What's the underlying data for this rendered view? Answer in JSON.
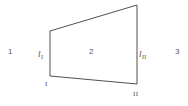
{
  "figure": {
    "type": "geometric-diagram",
    "background_color": "#ffffff",
    "stroke_color": "#55504f",
    "stroke_width": 1,
    "canvas": {
      "width": 188,
      "height": 106
    }
  },
  "shape": {
    "name": "quadrilateral",
    "vertices": [
      {
        "id": "top-left",
        "x": 50,
        "y": 31
      },
      {
        "id": "top-right",
        "x": 137,
        "y": 5
      },
      {
        "id": "bottom-right",
        "x": 137,
        "y": 84
      },
      {
        "id": "bottom-left",
        "x": 50,
        "y": 76
      }
    ],
    "path": "M 50 31 L 137 5 L 137 84 L 50 76 Z"
  },
  "regions": [
    {
      "id": "region-1",
      "label": "1",
      "position": "left-exterior"
    },
    {
      "id": "region-2",
      "label": "2",
      "position": "interior"
    },
    {
      "id": "region-3",
      "label": "3",
      "position": "right-exterior"
    }
  ],
  "edge_labels": [
    {
      "id": "edge-I",
      "symbol": "l",
      "subscript": "I",
      "edge": "left-vertical"
    },
    {
      "id": "edge-II",
      "symbol": "l",
      "subscript": "II",
      "edge": "right-vertical"
    }
  ],
  "vertex_labels": [
    {
      "id": "vertex-I",
      "label": "I",
      "anchor": "bottom-left-vertex"
    },
    {
      "id": "vertex-II",
      "label": "II",
      "anchor": "bottom-right-vertex"
    }
  ]
}
